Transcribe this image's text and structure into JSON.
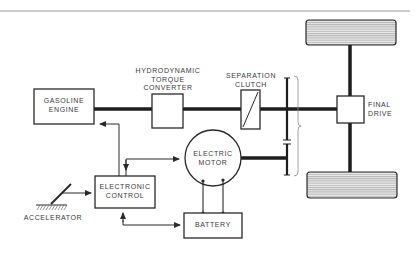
{
  "diagram": {
    "title": "",
    "type": "block diagram",
    "colors": {
      "line": "#2a2a2a",
      "wheel_fill": "#cfcfcf",
      "background": "#ffffff",
      "text": "#3a3a3a"
    },
    "nodes": {
      "gasoline_engine": {
        "lines": [
          "GASOLINE",
          "ENGINE"
        ]
      },
      "torque_converter": {
        "lines": [
          "HYDRODYNAMIC",
          "TORQUE",
          "CONVERTER"
        ]
      },
      "separation_clutch": {
        "lines": [
          "SEPARATION",
          "CLUTCH"
        ]
      },
      "final_drive": {
        "lines": [
          "FINAL",
          "DRIVE"
        ]
      },
      "electric_motor": {
        "lines": [
          "ELECTRIC",
          "MOTOR"
        ]
      },
      "electronic_control": {
        "lines": [
          "ELECTRONIC",
          "CONTROL"
        ]
      },
      "battery": {
        "lines": [
          "BATTERY"
        ]
      },
      "accelerator": {
        "lines": [
          "ACCELERATOR"
        ]
      }
    },
    "edges": [
      {
        "from": "gasoline_engine",
        "to": "torque_converter",
        "kind": "mechanical-shaft"
      },
      {
        "from": "torque_converter",
        "to": "separation_clutch",
        "kind": "mechanical-shaft"
      },
      {
        "from": "separation_clutch",
        "to": "final_drive",
        "kind": "mechanical-shaft"
      },
      {
        "from": "electric_motor",
        "to": "final_drive",
        "kind": "mechanical-shaft"
      },
      {
        "from": "final_drive",
        "to": "front_wheel",
        "kind": "axle"
      },
      {
        "from": "final_drive",
        "to": "rear_wheel",
        "kind": "axle"
      },
      {
        "from": "electronic_control",
        "to": "gasoline_engine",
        "kind": "signal"
      },
      {
        "from": "electronic_control",
        "to": "electric_motor",
        "kind": "signal"
      },
      {
        "from": "electronic_control",
        "to": "battery",
        "kind": "signal"
      },
      {
        "from": "accelerator",
        "to": "electronic_control",
        "kind": "signal"
      },
      {
        "from": "electric_motor",
        "to": "battery",
        "kind": "electrical"
      }
    ]
  }
}
